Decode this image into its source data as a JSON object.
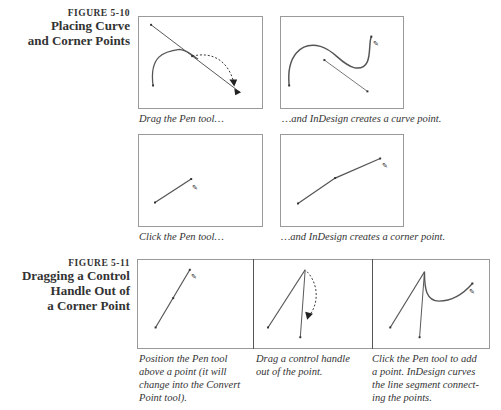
{
  "figure_5_10": {
    "number": "FIGURE 5-10",
    "title_line1": "Placing Curve",
    "title_line2": "and Corner Points",
    "panels": [
      {
        "caption": "Drag the Pen tool…",
        "illustration": "pen-drag-curve-handle"
      },
      {
        "caption": "…and InDesign creates a curve point.",
        "illustration": "curve-point-created"
      },
      {
        "caption": "Click the Pen tool…",
        "illustration": "pen-click-segment"
      },
      {
        "caption": "…and InDesign creates a corner point.",
        "illustration": "corner-point-created"
      }
    ]
  },
  "figure_5_11": {
    "number": "FIGURE 5-11",
    "title_line1": "Dragging a Control",
    "title_line2": "Handle Out of",
    "title_line3": "a Corner Point",
    "panels": [
      {
        "caption_lines": [
          "Position the Pen tool",
          "above a point (it will",
          "change into the Convert",
          "Point tool)."
        ],
        "illustration": "convert-point-cursor"
      },
      {
        "caption_lines": [
          "Drag a control handle",
          "out of the point."
        ],
        "illustration": "drag-control-handle"
      },
      {
        "caption_lines": [
          "Click the Pen tool to add",
          "a point. InDesign curves",
          "the line segment connect-",
          "ing the points."
        ],
        "illustration": "curved-segment-result"
      }
    ]
  },
  "colors": {
    "frame": "#9a9a9a",
    "path": "#555555",
    "text": "#333333"
  }
}
